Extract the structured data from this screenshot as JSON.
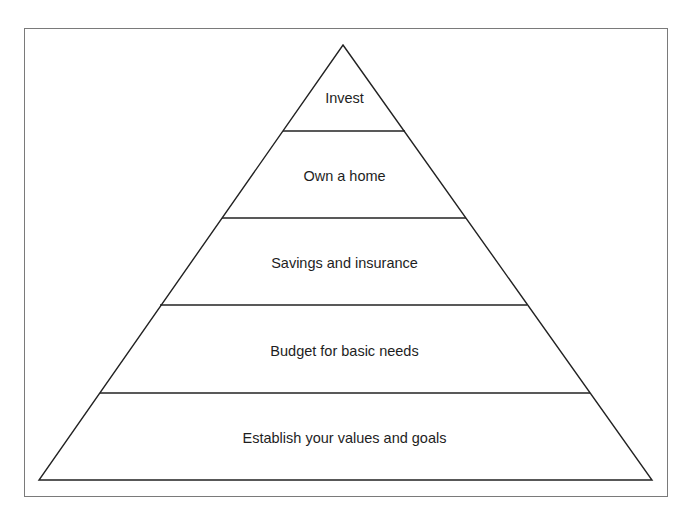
{
  "diagram": {
    "type": "pyramid",
    "levels": [
      {
        "label": "Invest"
      },
      {
        "label": "Own a home"
      },
      {
        "label": "Savings and insurance"
      },
      {
        "label": "Budget for basic needs"
      },
      {
        "label": "Establish your values and goals"
      }
    ]
  }
}
